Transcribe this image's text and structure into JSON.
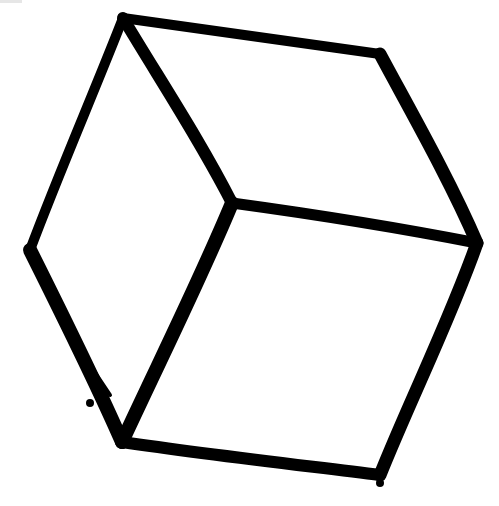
{
  "image": {
    "subject": "hand-drawn cube sketch",
    "background_color": "#ffffff",
    "ink_color": "#000000",
    "vertices": {
      "top": [
        123,
        17
      ],
      "top_right": [
        380,
        54
      ],
      "center": [
        232,
        203
      ],
      "right": [
        477,
        243
      ],
      "left": [
        30,
        250
      ],
      "bottom_left": [
        122,
        442
      ],
      "bottom_right": [
        380,
        475
      ]
    }
  }
}
